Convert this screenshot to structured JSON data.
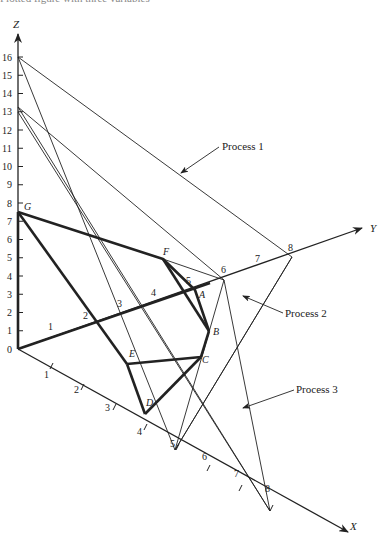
{
  "caption": "Plotted figure with three variables",
  "axes": {
    "z": {
      "label": "Z",
      "ticks": [
        "0",
        "1",
        "2",
        "3",
        "4",
        "5",
        "6",
        "7",
        "8",
        "9",
        "10",
        "11",
        "12",
        "13",
        "14",
        "15",
        "16"
      ]
    },
    "y": {
      "label": "Y",
      "ticks": [
        "1",
        "2",
        "3",
        "4",
        "5",
        "6",
        "7",
        "8"
      ]
    },
    "x": {
      "label": "X",
      "ticks": [
        "1",
        "2",
        "3",
        "4",
        "5",
        "6",
        "7",
        "8"
      ]
    }
  },
  "points": {
    "A": "A",
    "B": "B",
    "C": "C",
    "D": "D",
    "E": "E",
    "F": "F",
    "G": "G"
  },
  "labels": {
    "process1": "Process 1",
    "process2": "Process 2",
    "process3": "Process 3"
  },
  "colors": {
    "ink": "#222222",
    "background": "#ffffff"
  }
}
